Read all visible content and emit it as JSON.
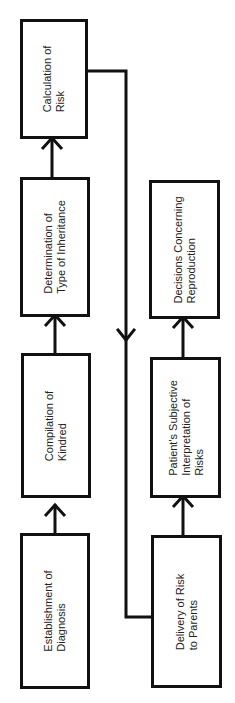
{
  "diagram": {
    "title": "",
    "nodes": [
      {
        "id": "establishment",
        "label": "Establishment of\nDiagnosis"
      },
      {
        "id": "compilation",
        "label": "Compilation of\nKindred"
      },
      {
        "id": "determination",
        "label": "Determination of\nType of Inheritance"
      },
      {
        "id": "calculation",
        "label": "Calculation of\nRisk"
      },
      {
        "id": "delivery",
        "label": "Delivery of Risk\nto Parents"
      },
      {
        "id": "interpretation",
        "label": "Patient's Subjective\nInterpretation of\nRisks"
      },
      {
        "id": "decisions",
        "label": "Decisions Concerning\nReproduction"
      }
    ],
    "edges": [
      {
        "from": "establishment",
        "to": "compilation"
      },
      {
        "from": "compilation",
        "to": "determination"
      },
      {
        "from": "determination",
        "to": "calculation"
      },
      {
        "from": "calculation",
        "to": "delivery"
      },
      {
        "from": "delivery",
        "to": "interpretation"
      },
      {
        "from": "interpretation",
        "to": "decisions"
      }
    ],
    "colors": {
      "line": "#111111",
      "background": "#ffffff",
      "text": "#222222"
    }
  }
}
